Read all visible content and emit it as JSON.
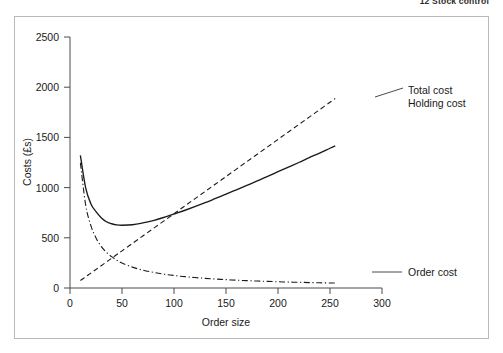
{
  "page": {
    "running_head": "12 Stock control",
    "background_color": "#ffffff",
    "frame_border_color": "#b9b9b9"
  },
  "chart_data": {
    "type": "line",
    "title": "",
    "xlabel": "Order size",
    "ylabel": "Costs (£s)",
    "xlim": [
      0,
      300
    ],
    "ylim": [
      0,
      2500
    ],
    "xticks": [
      0,
      50,
      100,
      150,
      200,
      250,
      300
    ],
    "yticks": [
      0,
      500,
      1000,
      1500,
      2000,
      2500
    ],
    "xtick_labels": [
      "0",
      "50",
      "100",
      "150",
      "200",
      "250",
      "300"
    ],
    "ytick_labels": [
      "0",
      "500",
      "1000",
      "1500",
      "2000",
      "2500"
    ],
    "grid": false,
    "legend_position": "inline-right-annotations",
    "line_color": "#1a1a1a",
    "x": [
      10,
      15,
      20,
      25,
      30,
      35,
      40,
      45,
      50,
      60,
      70,
      80,
      90,
      100,
      110,
      120,
      130,
      140,
      150,
      160,
      170,
      180,
      190,
      200,
      210,
      220,
      230,
      240,
      250,
      255
    ],
    "series": [
      {
        "name": "Total cost",
        "style": "solid",
        "label": "Total cost",
        "values": [
          1320,
          1000,
          840,
          760,
          700,
          660,
          640,
          628,
          625,
          630,
          648,
          672,
          702,
          736,
          772,
          810,
          850,
          892,
          934,
          978,
          1022,
          1066,
          1112,
          1158,
          1204,
          1250,
          1298,
          1344,
          1392,
          1415
        ]
      },
      {
        "name": "Holding cost",
        "style": "dashed",
        "label": "Holding cost",
        "values": [
          74,
          111,
          148,
          185,
          222,
          259,
          296,
          333,
          370,
          444,
          518,
          592,
          666,
          740,
          814,
          888,
          962,
          1036,
          1110,
          1184,
          1258,
          1332,
          1406,
          1480,
          1554,
          1628,
          1702,
          1776,
          1850,
          1887
        ]
      },
      {
        "name": "Order cost",
        "style": "dash-dot",
        "label": "Order cost",
        "values": [
          1246,
          831,
          623,
          499,
          415,
          356,
          312,
          277,
          249,
          208,
          178,
          156,
          138,
          125,
          113,
          104,
          96,
          89,
          83,
          78,
          73,
          69,
          66,
          62,
          59,
          57,
          54,
          52,
          50,
          49
        ]
      }
    ],
    "annotations": [
      {
        "text": "Total cost",
        "x_px": 408,
        "y_px": 91
      },
      {
        "text": "Holding cost",
        "x_px": 408,
        "y_px": 104
      },
      {
        "text": "Order cost",
        "x_px": 408,
        "y_px": 275
      }
    ]
  }
}
